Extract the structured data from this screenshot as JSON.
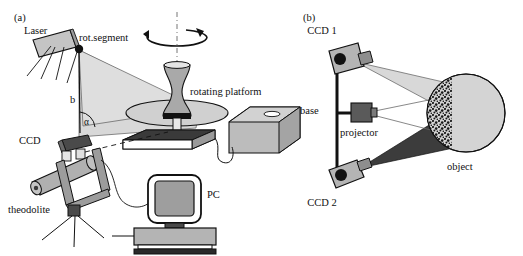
{
  "figure": {
    "panels": [
      {
        "id": "a",
        "label": "(a)",
        "title_hidden": "",
        "labels": {
          "laser": "Laser",
          "rot_segment": "rot.segment",
          "b": "b",
          "angle_symbol": "α",
          "ccd": "CCD",
          "theodolite": "theodolite",
          "rotating_platform": "rotating platform",
          "pc": "PC"
        }
      },
      {
        "id": "b",
        "label": "(b)",
        "labels": {
          "ccd1": "CCD 1",
          "ccd2": "CCD 2",
          "base": "base",
          "projector": "projector",
          "object": "object"
        }
      }
    ],
    "colors": {
      "stroke": "#111111",
      "light_fan": "#d8d8d8",
      "mid_gray": "#b4b4b4",
      "body_gray": "#a8a8a8",
      "dark_gray": "#4a4a4a",
      "darker_gray": "#383838",
      "black": "#111111",
      "white": "#ffffff",
      "screen_gray": "#9e9e9e",
      "platform_gray": "#c8c8c8"
    }
  }
}
